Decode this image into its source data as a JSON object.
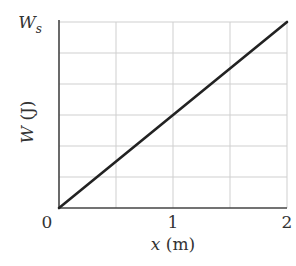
{
  "chart_data": {
    "type": "line",
    "title": "",
    "xlabel_var": "x",
    "xlabel_unit": " (m)",
    "ylabel_var": "W",
    "ylabel_unit": " (J)",
    "xlim": [
      0,
      2
    ],
    "ylim": [
      0,
      1
    ],
    "x_ticks": [
      0,
      1,
      2
    ],
    "x_tick_labels": [
      "0",
      "1",
      "2"
    ],
    "y_top_label_main": "W",
    "y_top_label_sub": "s",
    "x_grid": [
      0.5,
      1,
      1.5,
      2
    ],
    "y_grid_divisions": 6,
    "grid": true,
    "series": [
      {
        "name": "W(x)",
        "x": [
          0,
          2
        ],
        "y": [
          0,
          1
        ],
        "note": "y in units of W_s"
      }
    ],
    "colors": {
      "line": "#222222",
      "axis": "#444444",
      "grid": "#cfcfcf"
    }
  }
}
